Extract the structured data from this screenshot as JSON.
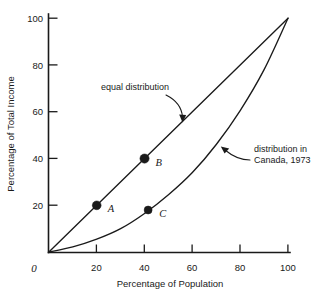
{
  "chart_data": {
    "type": "line",
    "title": "",
    "subtitle": "",
    "xlabel": "Percentage of Population",
    "ylabel": "Percentage of Total Income",
    "xlim": [
      0,
      100
    ],
    "ylim": [
      0,
      100
    ],
    "grid": false,
    "legend_position": "none",
    "xticks": [
      0,
      20,
      40,
      60,
      80,
      100
    ],
    "xtick_labels": [
      "0",
      "20",
      "40",
      "60",
      "80",
      "100"
    ],
    "yticks": [
      20,
      40,
      60,
      80,
      100
    ],
    "ytick_labels": [
      "20",
      "40",
      "60",
      "80",
      "100"
    ],
    "series": [
      {
        "name": "equal distribution",
        "x": [
          0,
          100
        ],
        "values": [
          0,
          100
        ]
      },
      {
        "name": "distribution in Canada, 1973",
        "x": [
          0,
          10,
          20,
          30,
          40,
          50,
          60,
          70,
          80,
          90,
          100
        ],
        "values": [
          0,
          2.2,
          5.5,
          10.0,
          16.5,
          24.5,
          34.0,
          46.0,
          60.5,
          78.0,
          100
        ]
      }
    ],
    "points": [
      {
        "label": "A",
        "x": 20,
        "y": 20,
        "on_series": "equal distribution"
      },
      {
        "label": "B",
        "x": 40,
        "y": 40,
        "on_series": "equal distribution"
      },
      {
        "label": "C",
        "x": 41.5,
        "y": 18,
        "on_series": "distribution in Canada, 1973"
      }
    ],
    "annotations": [
      {
        "text": "equal distribution",
        "text_x": 22,
        "text_y": 72,
        "points_to_x": 56,
        "points_to_y": 56
      },
      {
        "text_line_1": "distribution in",
        "text_line_2": "Canada, 1973",
        "text_x": 84,
        "text_y": 48,
        "points_to_x": 63,
        "points_to_y": 36
      }
    ]
  },
  "colors": {
    "ink": "#1a1a1a",
    "background": "#ffffff"
  }
}
